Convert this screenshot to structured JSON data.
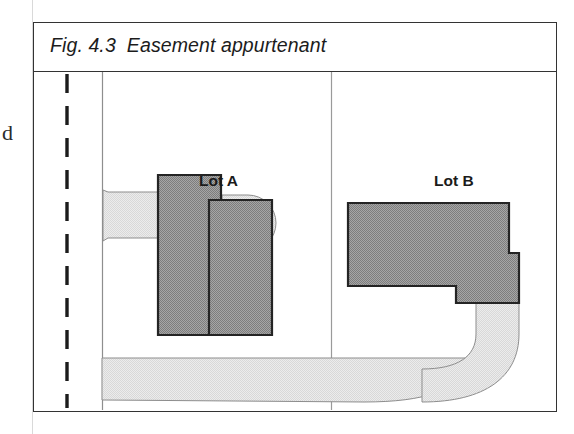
{
  "figure": {
    "caption": "Fig. 4.3  Easement appurtenant",
    "margin_glyph": "d"
  },
  "labels": {
    "lot_a": "Lot A",
    "lot_b": "Lot B",
    "easement": "Easement"
  },
  "colors": {
    "building_fill": "#9a9a9a",
    "building_stroke": "#242424",
    "easement_fill": "#e6e6e6",
    "easement_stroke": "#8d8d8d",
    "frame_stroke": "#333333",
    "boundary_line": "#8e8e8e",
    "road_dash": "#1c1c1c",
    "page_background": "#ffffff"
  },
  "diagram": {
    "type": "property-plan",
    "lots": [
      {
        "name": "Lot A",
        "divider_x": 330
      },
      {
        "name": "Lot B",
        "divider_x": 330
      }
    ],
    "features": [
      "dashed-road-centreline",
      "lot-a-building",
      "lot-a-driveway-stub",
      "lot-b-building",
      "easement-right-of-way"
    ]
  }
}
